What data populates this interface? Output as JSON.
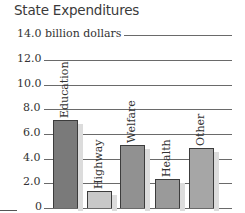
{
  "chart_data": {
    "type": "bar",
    "title": "State Expenditures",
    "ylabel": "billion dollars",
    "xlabel": "",
    "categories": [
      "Education",
      "Highway",
      "Welfare",
      "Health",
      "Other"
    ],
    "values": [
      7.1,
      1.4,
      5.1,
      2.35,
      4.85
    ],
    "ylim": [
      0,
      14.0
    ],
    "yticks": [
      0,
      2.0,
      4.0,
      6.0,
      8.0,
      10.0,
      12.0,
      14.0
    ],
    "ytick_labels": [
      "0",
      "2.0",
      "4.0",
      "6.0",
      "8.0",
      "10.0",
      "12.0",
      "14.0 billion dollars"
    ],
    "grid": true,
    "legend": null,
    "bar_colors": [
      "#7a7a7a",
      "#c8c8c8",
      "#919191",
      "#9a9a9a",
      "#a6a6a6"
    ],
    "label_placement": "rotated-above-bars"
  }
}
